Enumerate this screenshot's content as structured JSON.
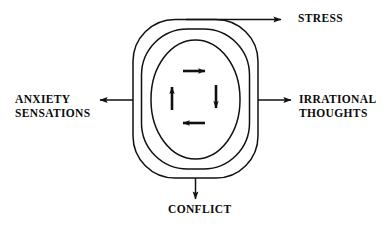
{
  "diagram": {
    "colors": {
      "stroke": "#111111",
      "text": "#0b0b0b",
      "background": "#ffffff"
    },
    "outer_labels": {
      "top": {
        "text": "STRESS",
        "direction": "up-right"
      },
      "left": {
        "line1": "ANXIETY",
        "line2": "SENSATIONS",
        "direction": "left"
      },
      "right": {
        "line1": "IRRATIONAL",
        "line2": "THOUGHTS",
        "direction": "right"
      },
      "bottom": {
        "text": "CONFLICT",
        "direction": "down"
      }
    },
    "rings": [
      {
        "name": "outer-ring",
        "corner_radius": 42
      },
      {
        "name": "middle-ring",
        "corner_radius": 46
      },
      {
        "name": "inner-ring",
        "corner_radius": 60
      }
    ],
    "inner_arrows": [
      {
        "name": "arrow-top-right",
        "direction": "right"
      },
      {
        "name": "arrow-right-down",
        "direction": "down"
      },
      {
        "name": "arrow-bottom-left",
        "direction": "left"
      },
      {
        "name": "arrow-left-up",
        "direction": "up"
      }
    ]
  }
}
